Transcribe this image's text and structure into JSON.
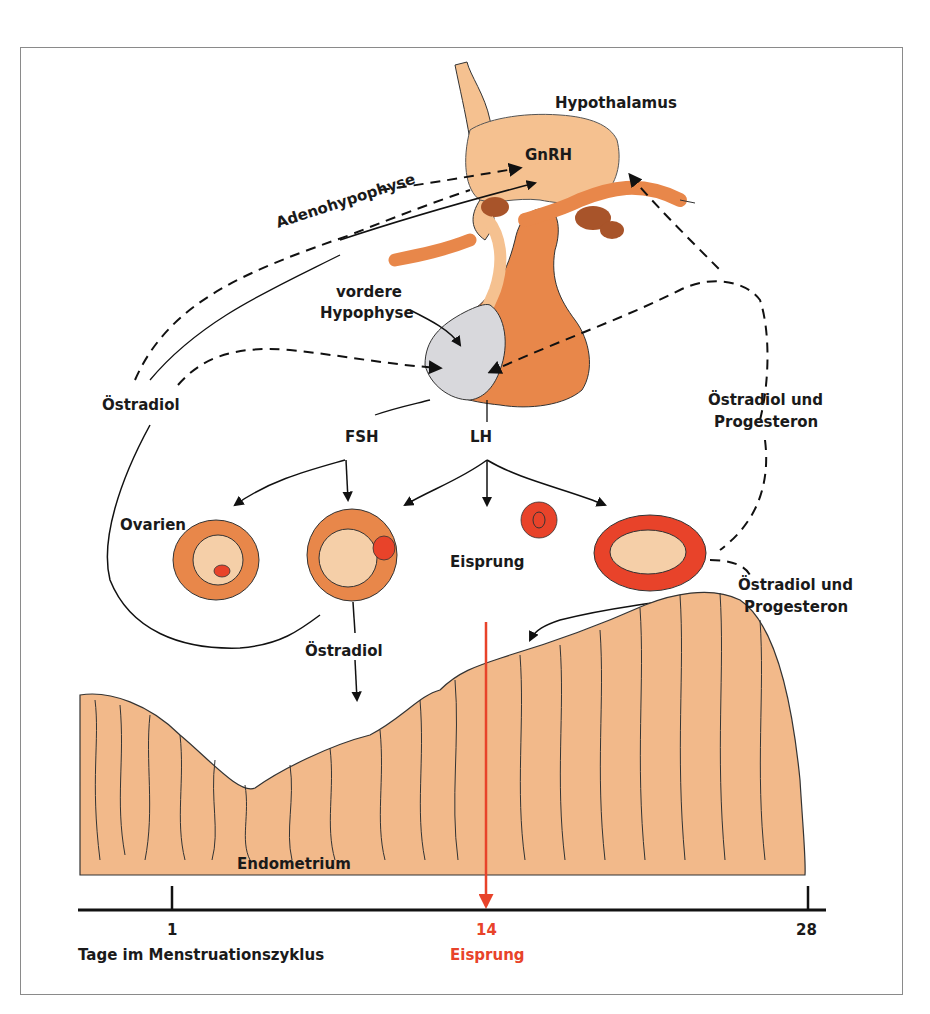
{
  "diagram": {
    "labels": {
      "hypothalamus": "Hypothalamus",
      "gnrh": "GnRH",
      "adenohypophyse": "Adenohypophyse",
      "vordere_line1": "vordere",
      "vordere_line2": "Hypophyse",
      "oestradiol_left": "Östradiol",
      "fsh": "FSH",
      "lh": "LH",
      "oestradiol_prog_right_line1": "Östradiol und",
      "oestradiol_prog_right_line2": "Progesteron",
      "ovarien": "Ovarien",
      "eisprung_mid": "Eisprung",
      "oestradiol_prog_lower_line1": "Östradiol und",
      "oestradiol_prog_lower_line2": "Progesteron",
      "oestradiol_follicle": "Östradiol",
      "endometrium": "Endometrium"
    },
    "timeline": {
      "ticks": [
        {
          "value": "1",
          "x": 172
        },
        {
          "value": "14",
          "x": 486,
          "highlight": true
        },
        {
          "value": "28",
          "x": 808
        }
      ],
      "axis_label": "Tage im Menstruationszyklus",
      "ovulation_label": "Eisprung"
    },
    "colors": {
      "hypothalamus_fill": "#f5c190",
      "pituitary_fill": "#e8874a",
      "anterior_pituitary": "#d8d8dc",
      "follicle_fill": "#e8874a",
      "corpus_luteum": "#e8432a",
      "endometrium_fill": "#f2b98a",
      "ovulation_red": "#e8432a",
      "ink": "#1a1a1a"
    }
  }
}
